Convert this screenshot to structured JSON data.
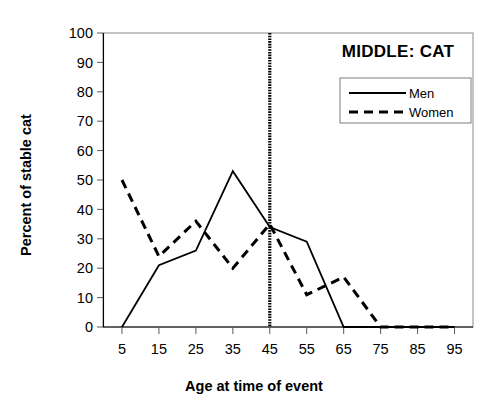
{
  "chart_data": {
    "type": "line",
    "title": "MIDDLE: CAT",
    "xlabel": "Age at time of event",
    "ylabel": "Percent of stable cat",
    "x": [
      5,
      15,
      25,
      35,
      45,
      55,
      65,
      75,
      85,
      95
    ],
    "xtick_labels": [
      "5",
      "15",
      "25",
      "35",
      "45",
      "55",
      "65",
      "75",
      "85",
      "95"
    ],
    "ytick_labels": [
      "0",
      "10",
      "20",
      "30",
      "40",
      "50",
      "60",
      "70",
      "80",
      "90",
      "100"
    ],
    "yticks": [
      0,
      10,
      20,
      30,
      40,
      50,
      60,
      70,
      80,
      90,
      100
    ],
    "xlim": [
      5,
      95
    ],
    "ylim": [
      0,
      100
    ],
    "grid": false,
    "legend_position": "top-right",
    "series": [
      {
        "name": "Men",
        "style": "solid",
        "color": "#000000",
        "values": [
          0,
          21,
          26,
          53,
          34,
          29,
          0,
          0,
          0,
          0
        ]
      },
      {
        "name": "Women",
        "style": "dashed",
        "color": "#000000",
        "values": [
          50,
          24,
          36,
          20,
          35,
          11,
          17,
          0,
          0,
          0
        ]
      }
    ],
    "annotations": [
      {
        "type": "vertical-reference-line",
        "name": "age-45-marker",
        "x": 45,
        "style": "dotted",
        "color": "#000000"
      }
    ]
  }
}
